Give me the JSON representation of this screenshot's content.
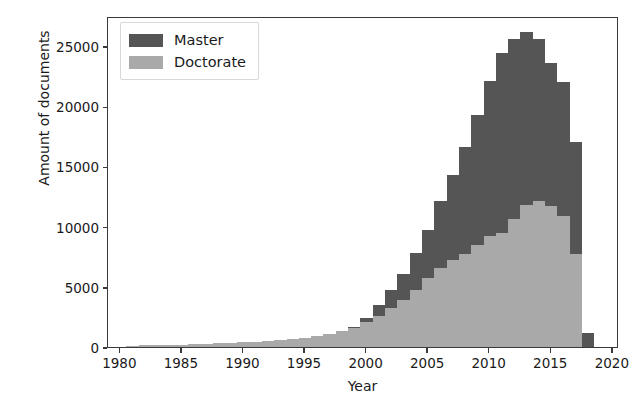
{
  "chart_data": {
    "type": "bar",
    "subtype": "stacked-bar",
    "title": "",
    "xlabel": "Year",
    "ylabel": "Amount of documents",
    "xlim": [
      1979,
      2020.5
    ],
    "ylim": [
      0,
      27500
    ],
    "grid": false,
    "legend_position": "upper left",
    "xticks": [
      1980,
      1985,
      1990,
      1995,
      2000,
      2005,
      2010,
      2015,
      2020
    ],
    "yticks": [
      0,
      5000,
      10000,
      15000,
      20000,
      25000
    ],
    "colors": {
      "master": "#555555",
      "doctorate": "#a9a9a9",
      "axis": "#3a3a3a",
      "background": "#ffffff"
    },
    "categories": [
      1980,
      1981,
      1982,
      1983,
      1984,
      1985,
      1986,
      1987,
      1988,
      1989,
      1990,
      1991,
      1992,
      1993,
      1994,
      1995,
      1996,
      1997,
      1998,
      1999,
      2000,
      2001,
      2002,
      2003,
      2004,
      2005,
      2006,
      2007,
      2008,
      2009,
      2010,
      2011,
      2012,
      2013,
      2014,
      2015,
      2016,
      2017,
      2018
    ],
    "series": [
      {
        "name": "Doctorate",
        "color": "#a9a9a9",
        "values": [
          0,
          90,
          150,
          160,
          170,
          200,
          230,
          260,
          300,
          340,
          380,
          430,
          500,
          560,
          650,
          760,
          900,
          1100,
          1350,
          1650,
          2050,
          2600,
          3200,
          3900,
          4700,
          5700,
          6600,
          7200,
          7700,
          8500,
          9200,
          9500,
          10600,
          11800,
          12100,
          11700,
          10900,
          7700,
          0
        ]
      },
      {
        "name": "Master",
        "color": "#555555",
        "values": [
          0,
          0,
          0,
          0,
          0,
          0,
          0,
          0,
          0,
          0,
          0,
          0,
          0,
          0,
          0,
          0,
          0,
          0,
          0,
          30,
          350,
          900,
          1500,
          2200,
          3100,
          4000,
          5500,
          7100,
          8900,
          10800,
          12900,
          14900,
          15000,
          14400,
          13500,
          11900,
          11100,
          9300,
          1200
        ]
      }
    ],
    "totals": [
      0,
      90,
      150,
      160,
      170,
      200,
      230,
      260,
      300,
      340,
      380,
      430,
      500,
      560,
      650,
      760,
      900,
      1100,
      1350,
      1650,
      2400,
      3500,
      4700,
      6100,
      7800,
      9700,
      12100,
      14300,
      16600,
      19300,
      22100,
      24400,
      25600,
      26200,
      25600,
      23600,
      22000,
      17000,
      1200
    ]
  },
  "legend": {
    "entries": [
      {
        "label": "Master",
        "swatch": "master"
      },
      {
        "label": "Doctorate",
        "swatch": "doctorate"
      }
    ]
  }
}
